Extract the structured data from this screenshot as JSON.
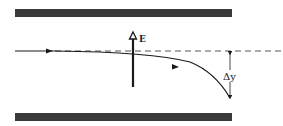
{
  "diagram": {
    "title": "",
    "field_label": "E",
    "deflection_label": "Δy",
    "colors": {
      "plate": "#3a3a3a",
      "line": "#1a1a1a",
      "dashed": "#555555",
      "background": "#ffffff"
    },
    "elements": [
      "top-plate",
      "bottom-plate",
      "electric-field-arrow",
      "undeflected-path-dashed",
      "deflected-trajectory",
      "deflection-dimension"
    ]
  }
}
